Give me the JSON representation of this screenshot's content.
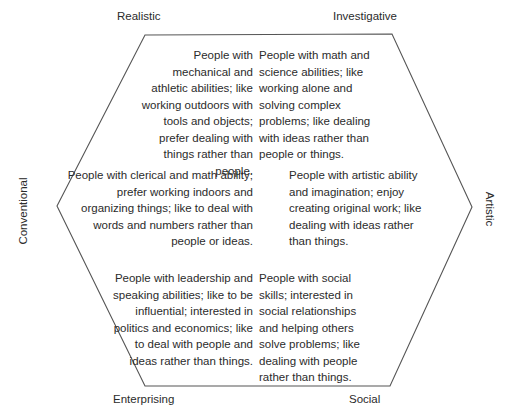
{
  "diagram": {
    "shape": "hexagon",
    "stroke_color": "#555555",
    "text_color": "#2b2b2b",
    "background_color": "#ffffff"
  },
  "vertices": {
    "realistic": "Realistic",
    "investigative": "Investigative",
    "enterprising": "Enterprising",
    "social": "Social"
  },
  "sides": {
    "conventional": "Conventional",
    "artistic": "Artistic"
  },
  "descriptions": {
    "realistic": "People with mechanical and athletic abilities; like working outdoors with tools and objects; prefer dealing with things rather than people.",
    "investigative": "People with math and science abilities; like working alone and solving complex problems; like dealing with ideas rather than people or things.",
    "conventional": "People with clerical and math ability; prefer working indoors and organizing things; like to deal with words and numbers rather than people or ideas.",
    "artistic": "People with artistic ability and imagination; enjoy creating original work; like dealing with ideas rather than things.",
    "enterprising": "People with leadership and speaking abilities; like to be influential; interested in politics and economics; like to deal with people and ideas rather than things.",
    "social": "People with social skills; interested in social relationships and helping others solve problems; like dealing with people rather than things."
  },
  "hexagon_points": "145,35 392,34 472,207 390,386 145,386 57,206"
}
